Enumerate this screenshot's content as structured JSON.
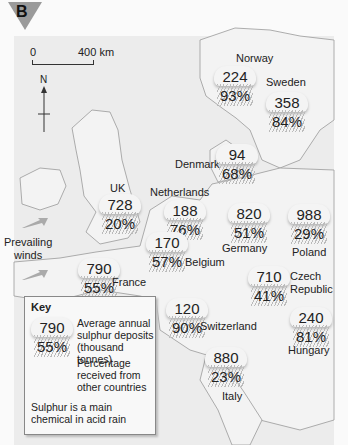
{
  "figure": {
    "badge": "B",
    "scale": {
      "start": "0",
      "end": "400 km"
    },
    "north_label": "N",
    "prevailing_winds_label": "Prevailing winds"
  },
  "countries": [
    {
      "name": "Norway",
      "deposits": "224",
      "percent": "93%"
    },
    {
      "name": "Sweden",
      "deposits": "358",
      "percent": "84%"
    },
    {
      "name": "Denmark",
      "deposits": "94",
      "percent": "68%"
    },
    {
      "name": "UK",
      "deposits": "728",
      "percent": "20%"
    },
    {
      "name": "Netherlands",
      "deposits": "188",
      "percent": "76%"
    },
    {
      "name": "Germany",
      "deposits": "820",
      "percent": "51%"
    },
    {
      "name": "Poland",
      "deposits": "988",
      "percent": "29%"
    },
    {
      "name": "Belgium",
      "deposits": "170",
      "percent": "57%"
    },
    {
      "name": "France",
      "deposits": "790",
      "percent": "55%"
    },
    {
      "name": "Czech Republic",
      "deposits": "710",
      "percent": "41%"
    },
    {
      "name": "Switzerland",
      "deposits": "120",
      "percent": "90%"
    },
    {
      "name": "Hungary",
      "deposits": "240",
      "percent": "81%"
    },
    {
      "name": "Italy",
      "deposits": "880",
      "percent": "23%"
    }
  ],
  "labels": {
    "czech_line1": "Czech",
    "czech_line2": "Republic",
    "winds_line1": "Prevailing",
    "winds_line2": "winds"
  },
  "key": {
    "title": "Key",
    "example_deposits": "790",
    "example_percent": "55%",
    "deposits_desc_1": "Average annual",
    "deposits_desc_2": "sulphur deposits",
    "deposits_desc_3": "(thousand tonnes)",
    "percent_desc_1": "Percentage",
    "percent_desc_2": "received from",
    "percent_desc_3": "other countries",
    "note_1": "Sulphur is a main",
    "note_2": "chemical in acid rain"
  }
}
